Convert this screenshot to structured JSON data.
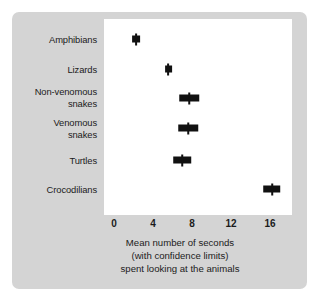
{
  "figure": {
    "panel_color": "#d4d4d4",
    "plot_background": "#ffffff",
    "marker_color": "#111111"
  },
  "caption": {
    "line1": "Mean number of seconds",
    "line2": "(with confidence limits)",
    "line3": "spent looking at the animals"
  },
  "chart_data": {
    "type": "scatter",
    "title": "",
    "subtitle": "",
    "xlabel": "Mean number of seconds (with confidence limits) spent looking at the animals",
    "ylabel": "",
    "orientation": "horizontal",
    "grid": false,
    "legend": "none",
    "xlim": [
      0,
      17.2
    ],
    "xticks": [
      0,
      4,
      8,
      12,
      16
    ],
    "xtick_labels": [
      "0",
      "4",
      "8",
      "12",
      "16"
    ],
    "categories": [
      "Amphibians",
      "Lizards",
      "Non-venomous\nsnakes",
      "Venomous\nsnakes",
      "Turtles",
      "Crocodilians"
    ],
    "values": [
      2.3,
      5.6,
      7.7,
      7.6,
      7.0,
      16.2
    ],
    "ci_low": [
      1.9,
      5.2,
      6.7,
      6.6,
      6.1,
      15.3
    ],
    "ci_high": [
      2.7,
      6.0,
      8.7,
      8.6,
      7.9,
      17.1
    ],
    "points": [
      {
        "category": "Amphibians",
        "value": 2.3,
        "ci_low": 1.9,
        "ci_high": 2.7
      },
      {
        "category": "Lizards",
        "value": 5.6,
        "ci_low": 5.2,
        "ci_high": 6.0
      },
      {
        "category": "Non-venomous snakes",
        "value": 7.7,
        "ci_low": 6.7,
        "ci_high": 8.7
      },
      {
        "category": "Venomous snakes",
        "value": 7.6,
        "ci_low": 6.6,
        "ci_high": 8.6
      },
      {
        "category": "Turtles",
        "value": 7.0,
        "ci_low": 6.1,
        "ci_high": 7.9
      },
      {
        "category": "Crocodilians",
        "value": 16.2,
        "ci_low": 15.3,
        "ci_high": 17.1
      }
    ]
  }
}
